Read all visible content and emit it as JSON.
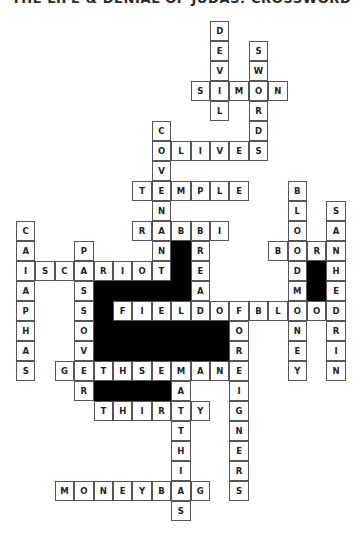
{
  "title": "THE LIFE & DENIAL OF JUDAS: CROSSWORD",
  "grid": {
    "cell_width": 19.4,
    "cell_height": 20,
    "words": [
      {
        "answer": "DEVIL",
        "dir": "down",
        "row": 0,
        "col": 10
      },
      {
        "answer": "SWORDS",
        "dir": "down",
        "row": 1,
        "col": 12
      },
      {
        "answer": "SIMON",
        "dir": "across",
        "row": 3,
        "col": 9
      },
      {
        "answer": "COVENANT",
        "dir": "down",
        "row": 5,
        "col": 7
      },
      {
        "answer": "OLIVES",
        "dir": "across",
        "row": 6,
        "col": 7
      },
      {
        "answer": "TEMPLE",
        "dir": "across",
        "row": 8,
        "col": 6
      },
      {
        "answer": "BLOODMONEY",
        "dir": "down",
        "row": 8,
        "col": 14
      },
      {
        "answer": "SANHEDRIN",
        "dir": "down",
        "row": 9,
        "col": 16
      },
      {
        "answer": "CAIAPHAS",
        "dir": "down",
        "row": 10,
        "col": 0
      },
      {
        "answer": "RABBI",
        "dir": "across",
        "row": 10,
        "col": 6
      },
      {
        "answer": "BREAD",
        "dir": "down",
        "row": 10,
        "col": 9
      },
      {
        "answer": "PASSOVER",
        "dir": "down",
        "row": 11,
        "col": 3
      },
      {
        "answer": "BORN",
        "dir": "across",
        "row": 11,
        "col": 13
      },
      {
        "answer": "ISCARIOT",
        "dir": "across",
        "row": 12,
        "col": 0
      },
      {
        "answer": "FIELDOFBLOOD",
        "dir": "across",
        "row": 14,
        "col": 5
      },
      {
        "answer": "FOREIGNERS",
        "dir": "down",
        "row": 14,
        "col": 11
      },
      {
        "answer": "GETHSEMANE",
        "dir": "across",
        "row": 17,
        "col": 2
      },
      {
        "answer": "MATTHIAS",
        "dir": "down",
        "row": 17,
        "col": 8
      },
      {
        "answer": "THIRTY",
        "dir": "across",
        "row": 19,
        "col": 4
      },
      {
        "answer": "MONEYBAG",
        "dir": "across",
        "row": 23,
        "col": 2
      }
    ],
    "blocks": [
      {
        "row": 11,
        "col": 8,
        "rows": 3,
        "cols": 1
      },
      {
        "row": 13,
        "col": 4,
        "rows": 1,
        "cols": 5
      },
      {
        "row": 14,
        "col": 4,
        "rows": 1,
        "cols": 1
      },
      {
        "row": 15,
        "col": 4,
        "rows": 2,
        "cols": 7
      },
      {
        "row": 18,
        "col": 4,
        "rows": 1,
        "cols": 4
      },
      {
        "row": 12,
        "col": 15,
        "rows": 2,
        "cols": 1
      }
    ]
  },
  "colors": {
    "border": "#555555",
    "block": "#000000",
    "letter": "#222222"
  }
}
